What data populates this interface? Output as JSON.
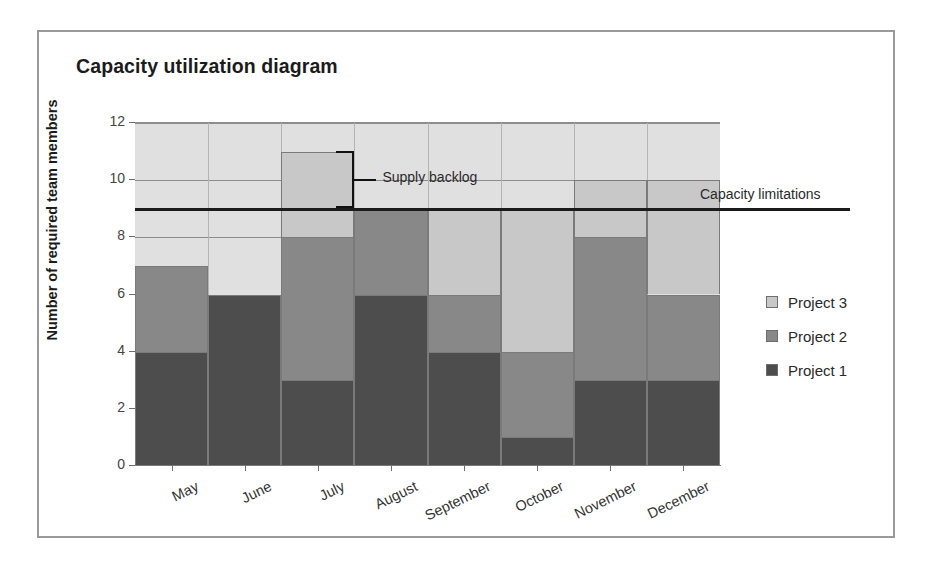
{
  "frame": {
    "border_color": "#9a9a9a"
  },
  "chart_data": {
    "type": "bar",
    "subtype": "stacked-bar",
    "title": "Capacity utilization diagram",
    "xlabel": "",
    "ylabel": "Number of required team members",
    "categories": [
      "May",
      "June",
      "July",
      "August",
      "September",
      "October",
      "November",
      "December"
    ],
    "series": [
      {
        "name": "Project 1",
        "color": "#4d4d4d",
        "values": [
          4,
          6,
          3,
          6,
          4,
          1,
          3,
          3
        ]
      },
      {
        "name": "Project 2",
        "color": "#888888",
        "values": [
          3,
          0,
          5,
          3,
          2,
          3,
          5,
          3
        ]
      },
      {
        "name": "Project 3",
        "color": "#c8c8c8",
        "values": [
          0,
          0,
          3,
          0,
          3,
          5,
          2,
          4
        ]
      }
    ],
    "totals": [
      7,
      6,
      11,
      9,
      9,
      9,
      10,
      10
    ],
    "ylim": [
      0,
      12
    ],
    "yticks": [
      0,
      2,
      4,
      6,
      8,
      10,
      12
    ],
    "ytick_labels": [
      "0",
      "2",
      "4",
      "6",
      "8",
      "10",
      "12"
    ],
    "grid": true,
    "legend_position": "right",
    "plot_background": "#e0e0e0",
    "annotations": [
      {
        "id": "capacity-limitations",
        "label": "Capacity limitations",
        "type": "horizontal-line",
        "value": 9,
        "color": "#1b1b1b"
      },
      {
        "id": "supply-backlog",
        "label": "Supply backlog",
        "type": "bracket",
        "from": 9,
        "to": 11,
        "category": "July",
        "color": "#111111"
      }
    ]
  },
  "legend": {
    "items": [
      {
        "label": "Project 3",
        "color": "#c8c8c8"
      },
      {
        "label": "Project 2",
        "color": "#888888"
      },
      {
        "label": "Project 1",
        "color": "#4d4d4d"
      }
    ]
  }
}
